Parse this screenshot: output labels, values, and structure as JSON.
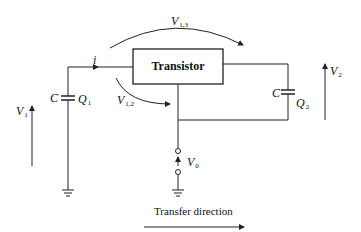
{
  "diagram": {
    "type": "circuit",
    "block": {
      "label": "Transistor"
    },
    "current": {
      "label": "i"
    },
    "input_capacitor": {
      "symbol": "C",
      "charge": "Q",
      "charge_sub": "1"
    },
    "output_capacitor": {
      "symbol": "C",
      "charge": "Q",
      "charge_sub": "2"
    },
    "voltages": {
      "v1": {
        "symbol": "V",
        "sub": "1"
      },
      "v2": {
        "symbol": "V",
        "sub": "2"
      },
      "v0": {
        "symbol": "V",
        "sub": "0"
      },
      "v12": {
        "symbol": "V",
        "sub": "1,2"
      },
      "v13": {
        "symbol": "V",
        "sub": "1,3"
      }
    },
    "transfer": {
      "label": "Transfer direction"
    },
    "colors": {
      "line": "#222222",
      "background": "#ffffff"
    }
  }
}
